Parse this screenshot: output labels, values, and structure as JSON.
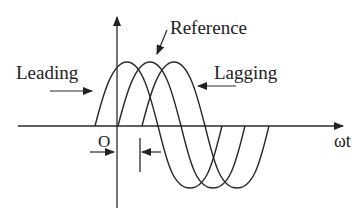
{
  "diagram": {
    "labels": {
      "reference": "Reference",
      "leading": "Leading",
      "lagging": "Lagging",
      "origin": "O",
      "x_axis": "ωt"
    },
    "waves": [
      {
        "name": "leading",
        "start_x": 95
      },
      {
        "name": "reference",
        "start_x": 118
      },
      {
        "name": "lagging",
        "start_x": 142
      }
    ],
    "colors": {
      "stroke": "#2a2a2a",
      "background": "#ffffff"
    }
  }
}
